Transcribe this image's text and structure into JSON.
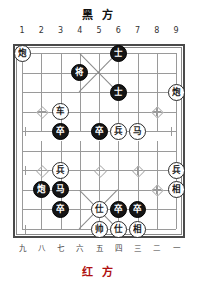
{
  "app": {
    "kind": "xiangqi-board-diagram"
  },
  "labels": {
    "top_side": "黑 方",
    "bottom_side": "红 方",
    "top_side_plain": "黑方",
    "bottom_side_plain": "红方"
  },
  "axes": {
    "top_files": [
      "1",
      "2",
      "3",
      "4",
      "5",
      "6",
      "7",
      "8",
      "9"
    ],
    "bottom_files": [
      "九",
      "八",
      "七",
      "六",
      "五",
      "四",
      "三",
      "二",
      "一"
    ]
  },
  "colors": {
    "board_line": "#9a9a9a",
    "board_border": "#4a4a4a",
    "black_piece_fill": "#151515",
    "black_piece_text": "#ffffff",
    "red_piece_fill": "#ffffff",
    "red_piece_text": "#1a1a1a",
    "bottom_title": "#b01010",
    "top_title": "#111111",
    "background": "#ffffff"
  },
  "board": {
    "files": 9,
    "ranks": 10,
    "pieces": [
      {
        "id": "p01",
        "char": "炮",
        "side": "red",
        "file": 1,
        "rank": 0
      },
      {
        "id": "p02",
        "char": "士",
        "side": "black",
        "file": 6,
        "rank": 0
      },
      {
        "id": "p03",
        "char": "将",
        "side": "black",
        "file": 4,
        "rank": 1
      },
      {
        "id": "p04",
        "char": "士",
        "side": "black",
        "file": 6,
        "rank": 2
      },
      {
        "id": "p05",
        "char": "炮",
        "side": "red",
        "file": 9,
        "rank": 2
      },
      {
        "id": "p06",
        "char": "车",
        "side": "red",
        "file": 3,
        "rank": 3
      },
      {
        "id": "p07",
        "char": "卒",
        "side": "black",
        "file": 3,
        "rank": 4
      },
      {
        "id": "p08",
        "char": "卒",
        "side": "black",
        "file": 5,
        "rank": 4
      },
      {
        "id": "p09",
        "char": "兵",
        "side": "red",
        "file": 6,
        "rank": 4
      },
      {
        "id": "p10",
        "char": "马",
        "side": "red",
        "file": 7,
        "rank": 4
      },
      {
        "id": "p11",
        "char": "兵",
        "side": "red",
        "file": 3,
        "rank": 6
      },
      {
        "id": "p12",
        "char": "兵",
        "side": "red",
        "file": 9,
        "rank": 6
      },
      {
        "id": "p13",
        "char": "炮",
        "side": "black",
        "file": 2,
        "rank": 7
      },
      {
        "id": "p14",
        "char": "马",
        "side": "black",
        "file": 3,
        "rank": 7
      },
      {
        "id": "p15",
        "char": "相",
        "side": "red",
        "file": 9,
        "rank": 7
      },
      {
        "id": "p16",
        "char": "卒",
        "side": "black",
        "file": 3,
        "rank": 8
      },
      {
        "id": "p17",
        "char": "仕",
        "side": "red",
        "file": 5,
        "rank": 8
      },
      {
        "id": "p18",
        "char": "卒",
        "side": "black",
        "file": 6,
        "rank": 8
      },
      {
        "id": "p19",
        "char": "卒",
        "side": "black",
        "file": 7,
        "rank": 8
      },
      {
        "id": "p20",
        "char": "帅",
        "side": "red",
        "file": 5,
        "rank": 9
      },
      {
        "id": "p21",
        "char": "仕",
        "side": "red",
        "file": 6,
        "rank": 9
      },
      {
        "id": "p22",
        "char": "相",
        "side": "red",
        "file": 7,
        "rank": 9
      }
    ],
    "star_points": [
      {
        "file": 2,
        "rank": 3,
        "type": "full"
      },
      {
        "file": 8,
        "rank": 3,
        "type": "full"
      },
      {
        "file": 2,
        "rank": 6,
        "type": "full"
      },
      {
        "file": 5,
        "rank": 6,
        "type": "full"
      },
      {
        "file": 7,
        "rank": 6,
        "type": "full"
      },
      {
        "file": 8,
        "rank": 7,
        "type": "full"
      }
    ],
    "edge_marks": [
      {
        "file": 1,
        "rank": 4,
        "type": "half-right"
      },
      {
        "file": 9,
        "rank": 4,
        "type": "half-left"
      },
      {
        "file": 1,
        "rank": 6,
        "type": "half-right"
      },
      {
        "file": 1,
        "rank": 9,
        "type": "half-right"
      }
    ]
  }
}
